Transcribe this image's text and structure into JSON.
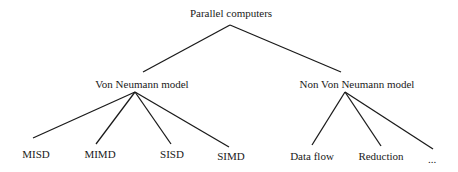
{
  "diagram": {
    "type": "tree",
    "root": {
      "label": "Parallel computers",
      "children": [
        {
          "label": "Von Neumann model",
          "children": [
            {
              "label": "MISD"
            },
            {
              "label": "MIMD"
            },
            {
              "label": "SISD"
            },
            {
              "label": "SIMD"
            }
          ]
        },
        {
          "label": "Non Von Neumann model",
          "children": [
            {
              "label": "Data flow"
            },
            {
              "label": "Reduction"
            },
            {
              "label": "..."
            }
          ]
        }
      ]
    }
  },
  "colors": {
    "line": "#1a1a1a",
    "text": "#1a1a1a",
    "background": "#ffffff"
  }
}
